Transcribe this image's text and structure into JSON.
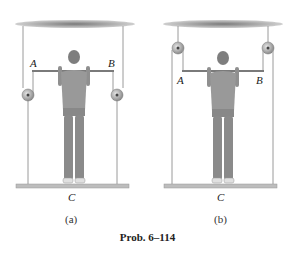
{
  "figure": {
    "caption": "Prob. 6–114",
    "panels": [
      {
        "id": "a",
        "sublabel": "(a)",
        "points": {
          "A": "A",
          "B": "B",
          "C": "C"
        },
        "pulley_position": "below bar, on side ropes"
      },
      {
        "id": "b",
        "sublabel": "(b)",
        "points": {
          "A": "A",
          "B": "B",
          "C": "C"
        },
        "pulley_position": "at ceiling, above bar"
      }
    ],
    "colors": {
      "ceiling": "#8a8a8a",
      "rope": "#9a9a9a",
      "platform": "#b8b8b8",
      "figure": "#8c8c8c",
      "pulley": "#a0a0a0"
    }
  }
}
